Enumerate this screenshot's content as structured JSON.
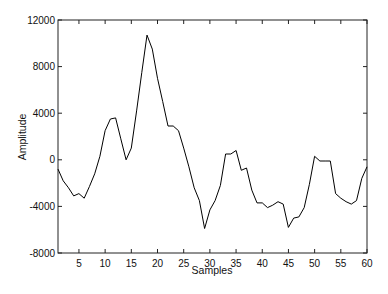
{
  "chart_data": {
    "type": "line",
    "title": "",
    "xlabel": "Samples",
    "ylabel": "Amplitude",
    "xlim": [
      1,
      60
    ],
    "ylim": [
      -8000,
      12000
    ],
    "grid": false,
    "legend": null,
    "xticks": [
      5,
      10,
      15,
      20,
      25,
      30,
      35,
      40,
      45,
      50,
      55,
      60
    ],
    "yticks": [
      -8000,
      -4000,
      0,
      4000,
      8000,
      12000
    ],
    "series": [
      {
        "name": "signal",
        "color": "#000000",
        "x": [
          1,
          2,
          3,
          4,
          5,
          6,
          7,
          8,
          9,
          10,
          11,
          12,
          13,
          14,
          15,
          16,
          17,
          18,
          19,
          20,
          21,
          22,
          23,
          24,
          25,
          26,
          27,
          28,
          29,
          30,
          31,
          32,
          33,
          34,
          35,
          36,
          37,
          38,
          39,
          40,
          41,
          42,
          43,
          44,
          45,
          46,
          47,
          48,
          49,
          50,
          51,
          52,
          53,
          54,
          55,
          56,
          57,
          58,
          59,
          60
        ],
        "values": [
          -800,
          -1800,
          -2400,
          -3100,
          -2900,
          -3300,
          -2300,
          -1200,
          300,
          2500,
          3500,
          3600,
          1800,
          0,
          1000,
          4200,
          7500,
          10700,
          9500,
          7000,
          5000,
          2900,
          2900,
          2500,
          1000,
          -600,
          -2400,
          -3500,
          -5900,
          -4300,
          -3500,
          -2200,
          500,
          500,
          800,
          -900,
          -700,
          -2600,
          -3700,
          -3700,
          -4100,
          -3900,
          -3600,
          -3800,
          -5800,
          -5000,
          -4900,
          -4100,
          -2100,
          300,
          -100,
          -100,
          -100,
          -2900,
          -3300,
          -3600,
          -3800,
          -3500,
          -1600,
          -600
        ]
      }
    ]
  },
  "axes": {
    "xlabel": "Samples",
    "ylabel": "Amplitude",
    "xtick_labels": [
      "5",
      "10",
      "15",
      "20",
      "25",
      "30",
      "35",
      "40",
      "45",
      "50",
      "55",
      "60"
    ],
    "ytick_labels": [
      "-8000",
      "-4000",
      "0",
      "4000",
      "8000",
      "12000"
    ]
  }
}
